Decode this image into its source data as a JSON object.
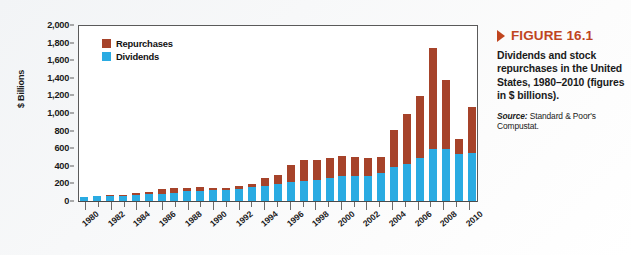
{
  "figure": {
    "number_label": "FIGURE 16.1",
    "caption": "Dividends and stock repurchases in the United States, 1980–2010 (figures in $ billions).",
    "source_label": "Source:",
    "source_text": " Standard & Poor's Compustat.",
    "accent_color": "#c0451f"
  },
  "legend": {
    "repurchases_label": "Repurchases",
    "dividends_label": "Dividends"
  },
  "chart_data": {
    "type": "bar",
    "title": "Dividends and stock repurchases in the United States, 1980–2010",
    "xlabel": "",
    "ylabel": "$ Billions",
    "ylim": [
      0,
      2000
    ],
    "ytick_labels": [
      "2,000",
      "1,800",
      "1,600",
      "1,400",
      "1,200",
      "1,000",
      "800",
      "600",
      "400",
      "200",
      "0"
    ],
    "ytick_values": [
      2000,
      1800,
      1600,
      1400,
      1200,
      1000,
      800,
      600,
      400,
      200,
      0
    ],
    "grid": false,
    "stacked": true,
    "legend_position": "top-left-inside",
    "categories": [
      1980,
      1981,
      1982,
      1983,
      1984,
      1985,
      1986,
      1987,
      1988,
      1989,
      1990,
      1991,
      1992,
      1993,
      1994,
      1995,
      1996,
      1997,
      1998,
      1999,
      2000,
      2001,
      2002,
      2003,
      2004,
      2005,
      2006,
      2007,
      2008,
      2009,
      2010
    ],
    "xtick_labels": [
      "1980",
      "1982",
      "1984",
      "1986",
      "1988",
      "1990",
      "1992",
      "1994",
      "1996",
      "1998",
      "2000",
      "2002",
      "2004",
      "2006",
      "2008",
      "2010"
    ],
    "series": [
      {
        "name": "Dividends",
        "color": "#2aabe2",
        "values": [
          55,
          65,
          72,
          72,
          78,
          88,
          95,
          105,
          120,
          130,
          135,
          135,
          150,
          165,
          185,
          205,
          225,
          240,
          255,
          270,
          290,
          295,
          300,
          330,
          400,
          430,
          500,
          600,
          600,
          540,
          560
        ]
      },
      {
        "name": "Repurchases",
        "color": "#a6432a",
        "values": [
          5,
          5,
          8,
          8,
          30,
          30,
          50,
          60,
          45,
          40,
          25,
          25,
          30,
          35,
          90,
          100,
          200,
          235,
          225,
          225,
          235,
          215,
          195,
          180,
          420,
          570,
          700,
          1150,
          790,
          180,
          520
        ]
      }
    ],
    "totals": [
      60,
      70,
      80,
      80,
      108,
      118,
      145,
      165,
      165,
      170,
      160,
      160,
      180,
      200,
      275,
      305,
      425,
      475,
      480,
      495,
      525,
      510,
      495,
      510,
      820,
      1000,
      1200,
      1750,
      1390,
      720,
      1080
    ]
  }
}
